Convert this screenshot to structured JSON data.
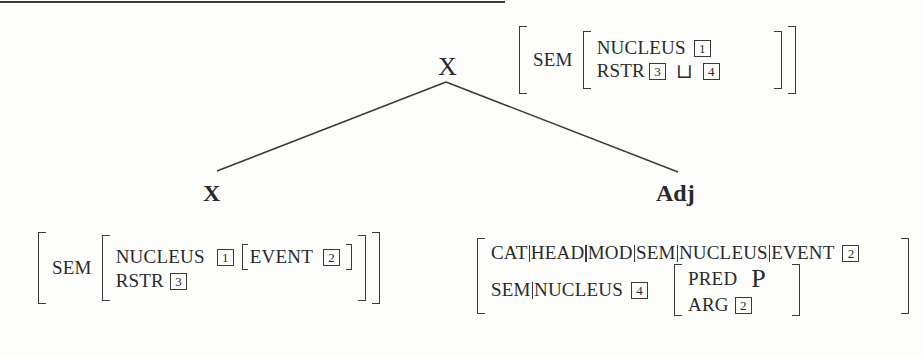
{
  "tree": {
    "root": {
      "label": "X"
    },
    "left_child": {
      "label": "X"
    },
    "right_child": {
      "label": "Adj"
    }
  },
  "root_avm": {
    "sem_label": "SEM",
    "rows": [
      {
        "feature": "NUCLEUS",
        "tag": "1"
      },
      {
        "feature": "RSTR",
        "tag_a": "3",
        "join_op": "⊔",
        "tag_b": "4"
      }
    ]
  },
  "left_avm": {
    "sem_label": "SEM",
    "rows": [
      {
        "feature": "NUCLEUS",
        "tag": "1",
        "inner_feature": "EVENT",
        "inner_tag": "2"
      },
      {
        "feature": "RSTR",
        "tag": "3"
      }
    ]
  },
  "right_avm": {
    "path1": [
      "CAT",
      "HEAD",
      "MOD",
      "SEM",
      "NUCLEUS",
      "EVENT"
    ],
    "path1_tag": "2",
    "path2": [
      "SEM",
      "NUCLEUS"
    ],
    "path2_tag": "4",
    "inner": [
      {
        "feature": "PRED",
        "value": "P"
      },
      {
        "feature": "ARG",
        "tag": "2"
      }
    ]
  },
  "colors": {
    "ink": "#2a2a2a",
    "paper": "#fdfdfc"
  }
}
